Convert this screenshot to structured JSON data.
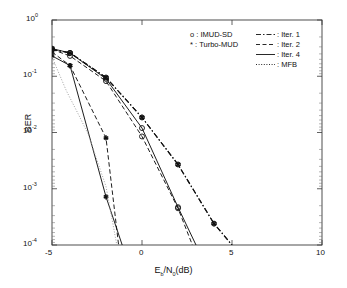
{
  "chart_data": {
    "type": "line",
    "title": "",
    "xlabel": "E_b/N_0(dB)",
    "xlabel_parts": {
      "pre": "E",
      "sub1": "b",
      "mid": "/N",
      "sub2": "0",
      "post": "(dB)"
    },
    "ylabel": "BER",
    "xlim": [
      -5,
      10
    ],
    "ylim": [
      0.0001,
      1
    ],
    "yscale": "log",
    "grid": false,
    "xticks": [
      -5,
      0,
      5,
      10
    ],
    "xticklabels": [
      "-5",
      "0",
      "5",
      "10"
    ],
    "yticks": [
      1,
      0.1,
      0.01,
      0.001,
      0.0001
    ],
    "yticklabels": [
      "10^0",
      "10^-1",
      "10^-2",
      "10^-3",
      "10^-4"
    ],
    "yticklabel_exponents": [
      "0",
      "-1",
      "-2",
      "-3",
      "-4"
    ],
    "legend_position": "upper-center",
    "marker_legend": [
      {
        "symbol": "o",
        "label": "IMUD-SD"
      },
      {
        "symbol": "*",
        "label": "Turbo-MUD"
      }
    ],
    "linestyle_legend": [
      {
        "style": "dash-dot",
        "label": "Iter. 1"
      },
      {
        "style": "dashed",
        "label": "Iter. 2"
      },
      {
        "style": "solid",
        "label": "Iter. 4"
      },
      {
        "style": "dotted",
        "label": "MFB"
      }
    ],
    "series": [
      {
        "name": "IMUD-SD Iter. 1",
        "marker": "o",
        "style": "dash-dot",
        "x": [
          -5,
          -4,
          -2,
          0,
          2,
          4,
          5
        ],
        "y": [
          0.3,
          0.26,
          0.095,
          0.0185,
          0.0027,
          0.00024,
          0.0001
        ]
      },
      {
        "name": "Turbo-MUD Iter. 1",
        "marker": "*",
        "style": "dash-dot",
        "x": [
          -5,
          -4,
          -2,
          0,
          2,
          4,
          5
        ],
        "y": [
          0.3,
          0.26,
          0.095,
          0.0185,
          0.0027,
          0.00024,
          0.0001
        ]
      },
      {
        "name": "IMUD-SD Iter. 2",
        "marker": "o",
        "style": "dashed",
        "x": [
          -5,
          -4,
          -2,
          0,
          2,
          2.8
        ],
        "y": [
          0.3,
          0.23,
          0.082,
          0.0085,
          0.00045,
          0.0001
        ]
      },
      {
        "name": "Turbo-MUD Iter. 2",
        "marker": "*",
        "style": "dashed",
        "x": [
          -5,
          -4,
          -2,
          -1.3
        ],
        "y": [
          0.27,
          0.155,
          0.008,
          0.0001
        ]
      },
      {
        "name": "IMUD-SD Iter. 4",
        "marker": "o",
        "style": "solid",
        "x": [
          -5,
          -4,
          -2,
          0,
          2,
          3
        ],
        "y": [
          0.31,
          0.26,
          0.09,
          0.012,
          0.00047,
          0.0001
        ]
      },
      {
        "name": "Turbo-MUD Iter. 4",
        "marker": "*",
        "style": "solid",
        "x": [
          -5,
          -4,
          -2,
          -1.1
        ],
        "y": [
          0.23,
          0.155,
          0.00072,
          0.0001
        ]
      },
      {
        "name": "MFB",
        "marker": "none",
        "style": "dotted",
        "x": [
          -5,
          -4.2,
          -3.5,
          -3,
          -2,
          -1.4
        ],
        "y": [
          0.22,
          0.055,
          0.02,
          0.0095,
          0.0011,
          0.0001
        ]
      }
    ]
  }
}
